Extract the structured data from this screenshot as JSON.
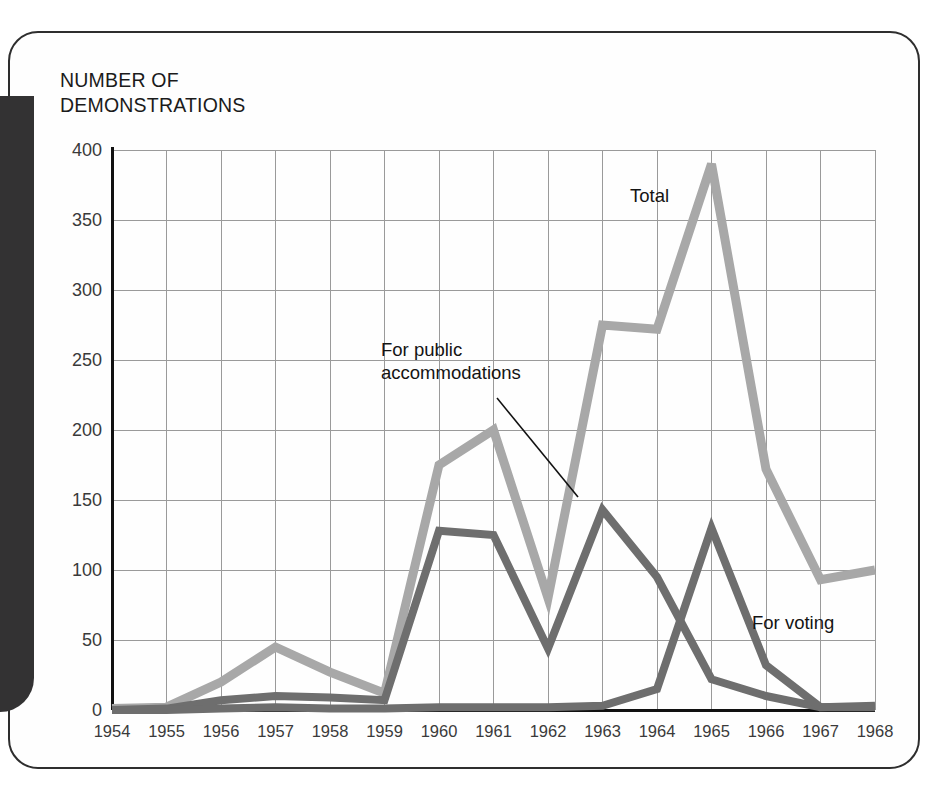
{
  "figure": {
    "axis_title": "NUMBER OF\nDEMONSTRATIONS",
    "frame_style": "rounded-rectangle",
    "gutter_color": "#333233"
  },
  "chart_data": {
    "type": "line",
    "title": "NUMBER OF DEMONSTRATIONS",
    "xlabel": "",
    "ylabel": "NUMBER OF DEMONSTRATIONS",
    "grid": true,
    "legend_position": "inline-annotations",
    "xlim": [
      1954,
      1968
    ],
    "ylim": [
      0,
      400
    ],
    "ytick_step": 50,
    "categories": [
      1954,
      1955,
      1956,
      1957,
      1958,
      1959,
      1960,
      1961,
      1962,
      1963,
      1964,
      1965,
      1966,
      1967,
      1968
    ],
    "xtick_labels": [
      "1954",
      "1955",
      "1956",
      "1957",
      "1958",
      "1959",
      "1960",
      "1961",
      "1962",
      "1963",
      "1964",
      "1965",
      "1966",
      "1967",
      "1968"
    ],
    "ytick_labels": [
      "0",
      "50",
      "100",
      "150",
      "200",
      "250",
      "300",
      "350",
      "400"
    ],
    "ytick_values": [
      0,
      50,
      100,
      150,
      200,
      250,
      300,
      350,
      400
    ],
    "series": [
      {
        "name": "Total",
        "label": "Total",
        "color": "#a8a8a8",
        "stroke_width": 9,
        "values": [
          1,
          2,
          20,
          45,
          27,
          12,
          175,
          200,
          80,
          275,
          272,
          390,
          172,
          93,
          100
        ]
      },
      {
        "name": "For public accommodations",
        "label": "For public\naccommodations",
        "color": "#6e6e6e",
        "stroke_width": 8,
        "values": [
          0,
          1,
          7,
          10,
          9,
          7,
          128,
          125,
          44,
          143,
          95,
          22,
          10,
          2,
          2
        ]
      },
      {
        "name": "For voting",
        "label": "For voting",
        "color": "#6e6e6e",
        "stroke_width": 8,
        "values": [
          0,
          0,
          1,
          2,
          1,
          1,
          2,
          2,
          2,
          3,
          15,
          130,
          32,
          2,
          3
        ]
      }
    ],
    "annotations": [
      {
        "text": "Total",
        "x_px": 630,
        "y_px": 184,
        "leader": false
      },
      {
        "text": "For public\naccommodations",
        "x_px": 381,
        "y_px": 338,
        "leader": true
      },
      {
        "text": "For voting",
        "x_px": 752,
        "y_px": 611,
        "leader": false
      }
    ]
  }
}
